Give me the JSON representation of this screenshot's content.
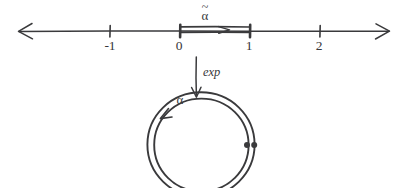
{
  "figure": {
    "title": "Exponential map from unit interval to circle",
    "background_color": "#ffffff",
    "ink_color": "#3a3a3c",
    "width": 406,
    "height": 188
  },
  "number_line": {
    "name": "real-number-line",
    "axis_y": 31,
    "x_start": 18,
    "x_end": 390,
    "left_arrowhead": true,
    "right_arrowhead": true,
    "unit_px": 70,
    "origin_x": 180,
    "ticks": [
      {
        "value": -1,
        "label": "-1",
        "x": 110,
        "label_x": 110,
        "label_y": 50
      },
      {
        "value": 0,
        "label": "0",
        "x": 180,
        "label_x": 179,
        "label_y": 50
      },
      {
        "value": 1,
        "label": "1",
        "x": 250,
        "label_x": 249,
        "label_y": 50
      },
      {
        "value": 2,
        "label": "2",
        "x": 320,
        "label_x": 319,
        "label_y": 50
      }
    ]
  },
  "path_segment": {
    "name": "alpha-tilde-path",
    "label": "α̃",
    "label_base": "α",
    "label_accent": "~",
    "label_x": 205,
    "label_y": 17,
    "from_value": 0,
    "to_value": 1,
    "from_x": 180,
    "to_x": 250,
    "rail_top_y": 27,
    "rail_bottom_y": 32,
    "endpoint_marker": "vertical-bar",
    "direction": "rightward",
    "inner_arrow_tip_x": 228,
    "inner_arrow_y": 30
  },
  "map_arrow": {
    "name": "exp-map-arrow",
    "label": "exp",
    "label_x": 206,
    "label_y": 75,
    "direction": "down",
    "x": 196,
    "y_start": 57,
    "y_end": 97
  },
  "circle": {
    "name": "alpha-loop",
    "label": "α",
    "label_x": 180,
    "label_y": 101,
    "center_x": 201,
    "center_y": 145,
    "outer_radius": 53,
    "inner_radius": 47,
    "double_stroke": true,
    "direction_arrowhead": {
      "present": true,
      "x": 163,
      "y": 116,
      "points": "down-left"
    },
    "basepoint_dots": [
      {
        "name": "outer-basepoint-dot",
        "x": 254,
        "y": 145
      },
      {
        "name": "inner-basepoint-dot",
        "x": 247,
        "y": 145
      }
    ]
  }
}
